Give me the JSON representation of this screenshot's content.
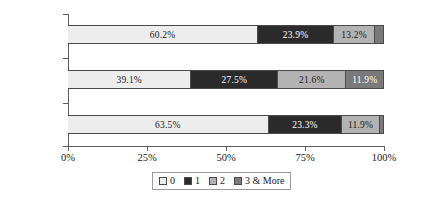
{
  "chart_data": {
    "type": "bar",
    "orientation": "horizontal",
    "stacked": true,
    "normalized_percent": true,
    "title": "",
    "subtitle": "",
    "xlabel": "",
    "ylabel": "",
    "xlim": [
      0,
      100
    ],
    "grid": false,
    "legend_position": "bottom",
    "categories": [
      "Total",
      "Ineligible",
      "Eligible"
    ],
    "tick_labels": [
      "0%",
      "25%",
      "50%",
      "75%",
      "100%"
    ],
    "tick_values": [
      0,
      25,
      50,
      75,
      100
    ],
    "legend": [
      "0",
      "1",
      "2",
      "3 & More"
    ],
    "colors": [
      "#ededed",
      "#2b2b2b",
      "#b3b3b3",
      "#7a7a7a"
    ],
    "series": [
      {
        "name": "0",
        "values": [
          60.2,
          39.1,
          63.5
        ]
      },
      {
        "name": "1",
        "values": [
          23.9,
          27.5,
          23.3
        ]
      },
      {
        "name": "2",
        "values": [
          13.2,
          21.6,
          11.9
        ]
      },
      {
        "name": "3 & More",
        "values": [
          2.7,
          11.9,
          1.3
        ]
      }
    ],
    "rows": [
      {
        "category": "Total",
        "segments": [
          {
            "series": "0",
            "value": 60.2,
            "label": "60.2%"
          },
          {
            "series": "1",
            "value": 23.9,
            "label": "23.9%"
          },
          {
            "series": "2",
            "value": 13.2,
            "label": "13.2%"
          },
          {
            "series": "3 & More",
            "value": 2.7,
            "label": ""
          }
        ]
      },
      {
        "category": "Ineligible",
        "segments": [
          {
            "series": "0",
            "value": 39.1,
            "label": "39.1%"
          },
          {
            "series": "1",
            "value": 27.5,
            "label": "27.5%"
          },
          {
            "series": "2",
            "value": 21.6,
            "label": "21.6%"
          },
          {
            "series": "3 & More",
            "value": 11.9,
            "label": "11.9%"
          }
        ]
      },
      {
        "category": "Eligible",
        "segments": [
          {
            "series": "0",
            "value": 63.5,
            "label": "63.5%"
          },
          {
            "series": "1",
            "value": 23.3,
            "label": "23.3%"
          },
          {
            "series": "2",
            "value": 11.9,
            "label": "11.9%"
          },
          {
            "series": "3 & More",
            "value": 1.3,
            "label": ""
          }
        ]
      }
    ]
  }
}
